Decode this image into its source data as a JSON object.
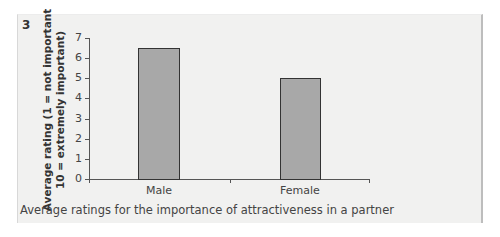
{
  "figure": {
    "number": "3",
    "caption": "Average ratings for the importance of attractiveness in a partner"
  },
  "colors": {
    "panel_bg": "#f1f1f0",
    "bar_fill": "#a8a8a8",
    "bar_stroke": "#333333",
    "axis": "#555555"
  },
  "chart_data": {
    "type": "bar",
    "title": "",
    "caption": "Average ratings for the importance of attractiveness in a partner",
    "xlabel": "",
    "ylabel": "Average rating (1 = not important 10 = extremely important)",
    "ylabel_lines": [
      "Average rating (1 = not important",
      "10 = extremely important)"
    ],
    "categories": [
      "Male",
      "Female"
    ],
    "values": [
      6.5,
      5.0
    ],
    "ylim": [
      0,
      7
    ],
    "yticks": [
      "0",
      "1",
      "2",
      "3",
      "4",
      "5",
      "6",
      "7"
    ],
    "grid": false,
    "legend": null
  }
}
